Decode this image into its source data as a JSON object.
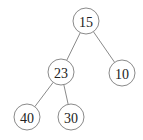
{
  "diagram": {
    "type": "binary-tree",
    "colors": {
      "stroke": "#8a8a8a",
      "text": "#222222",
      "background": "#ffffff"
    },
    "node_radius": 13,
    "nodes": [
      {
        "id": "n15",
        "label": "15",
        "x": 86,
        "y": 21
      },
      {
        "id": "n23",
        "label": "23",
        "x": 61,
        "y": 72
      },
      {
        "id": "n10",
        "label": "10",
        "x": 122,
        "y": 73
      },
      {
        "id": "n40",
        "label": "40",
        "x": 27,
        "y": 117
      },
      {
        "id": "n30",
        "label": "30",
        "x": 71,
        "y": 117
      }
    ],
    "edges": [
      {
        "from": "n15",
        "to": "n23"
      },
      {
        "from": "n15",
        "to": "n10"
      },
      {
        "from": "n23",
        "to": "n40"
      },
      {
        "from": "n23",
        "to": "n30"
      }
    ]
  }
}
